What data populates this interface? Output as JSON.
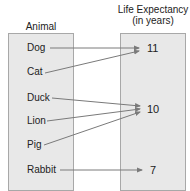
{
  "diagram": {
    "type": "mapping",
    "domain_header": "Animal",
    "range_header_line1": "Life Expectancy",
    "range_header_line2": "(in years)",
    "domain": [
      {
        "label": "Dog",
        "y": 48
      },
      {
        "label": "Cat",
        "y": 72
      },
      {
        "label": "Duck",
        "y": 98
      },
      {
        "label": "Lion",
        "y": 121
      },
      {
        "label": "Pig",
        "y": 145
      },
      {
        "label": "Rabbit",
        "y": 170
      }
    ],
    "range": [
      {
        "label": "11",
        "y": 48
      },
      {
        "label": "10",
        "y": 109
      },
      {
        "label": "7",
        "y": 170
      }
    ],
    "mappings": [
      {
        "from": "Dog",
        "to": "11"
      },
      {
        "from": "Cat",
        "to": "11"
      },
      {
        "from": "Duck",
        "to": "10"
      },
      {
        "from": "Lion",
        "to": "10"
      },
      {
        "from": "Pig",
        "to": "10"
      },
      {
        "from": "Rabbit",
        "to": "7"
      }
    ],
    "colors": {
      "box_fill": "#e8e8e8",
      "box_border": "#a8a8a8",
      "arrow": "#7a7a7a"
    }
  }
}
